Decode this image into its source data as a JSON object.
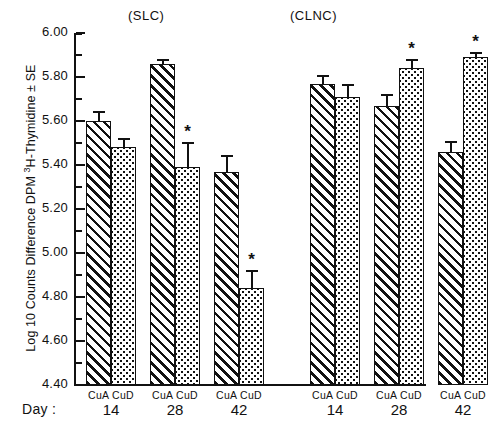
{
  "chart_data": {
    "type": "bar",
    "title": "",
    "xlabel": "Day :",
    "ylabel": "Log 10 Counts Difference DPM 3H-Thymidine ± SE",
    "ylim": [
      4.4,
      6.0
    ],
    "ytick_step": 0.2,
    "yminor_step": 0.1,
    "grid": false,
    "legend": "none",
    "ytick_labels": [
      "6.00",
      "5.80",
      "5.60",
      "5.40",
      "5.20",
      "5.00",
      "4.80",
      "4.60",
      "4.40"
    ],
    "ytick_values": [
      6.0,
      5.8,
      5.6,
      5.4,
      5.2,
      5.0,
      4.8,
      4.6,
      4.4
    ],
    "groups": [
      {
        "name": "(SLC)",
        "days": [
          {
            "day": "14",
            "bars": [
              {
                "label": "CuA",
                "fill": "hatch",
                "value": 5.6,
                "err": 0.045,
                "sig": ""
              },
              {
                "label": "CuD",
                "fill": "dots",
                "value": 5.48,
                "err": 0.045,
                "sig": ""
              }
            ]
          },
          {
            "day": "28",
            "bars": [
              {
                "label": "CuA",
                "fill": "hatch",
                "value": 5.86,
                "err": 0.022,
                "sig": ""
              },
              {
                "label": "CuD",
                "fill": "dots",
                "value": 5.39,
                "err": 0.115,
                "sig": "*"
              }
            ]
          },
          {
            "day": "42",
            "bars": [
              {
                "label": "CuA",
                "fill": "hatch",
                "value": 5.37,
                "err": 0.075,
                "sig": ""
              },
              {
                "label": "CuD",
                "fill": "dots",
                "value": 4.84,
                "err": 0.085,
                "sig": "*"
              }
            ]
          }
        ]
      },
      {
        "name": "(CLNC)",
        "days": [
          {
            "day": "14",
            "bars": [
              {
                "label": "CuA",
                "fill": "hatch",
                "value": 5.77,
                "err": 0.04,
                "sig": ""
              },
              {
                "label": "CuD",
                "fill": "dots",
                "value": 5.71,
                "err": 0.06,
                "sig": ""
              }
            ]
          },
          {
            "day": "28",
            "bars": [
              {
                "label": "CuA",
                "fill": "hatch",
                "value": 5.67,
                "err": 0.055,
                "sig": ""
              },
              {
                "label": "CuD",
                "fill": "dots",
                "value": 5.84,
                "err": 0.04,
                "sig": "*"
              }
            ]
          },
          {
            "day": "42",
            "bars": [
              {
                "label": "CuA",
                "fill": "hatch",
                "value": 5.46,
                "err": 0.048,
                "sig": ""
              },
              {
                "label": "CuD",
                "fill": "dots",
                "value": 5.89,
                "err": 0.025,
                "sig": "*"
              }
            ]
          }
        ]
      }
    ],
    "colors": {
      "ink": "#111111",
      "background": "#ffffff"
    }
  },
  "axis": {
    "y_label_prefix": "Log 10 Counts Difference DPM ",
    "y_label_sup": "3",
    "y_label_suffix": "H-Thymidine ± SE"
  },
  "xaxis": {
    "day_caption": "Day :"
  }
}
